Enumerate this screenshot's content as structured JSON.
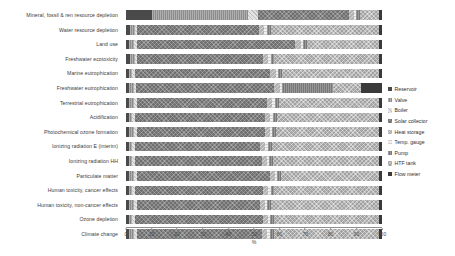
{
  "chart_data": {
    "type": "bar",
    "orientation": "horizontal",
    "stacked": true,
    "stack_mode": "percent",
    "title": "",
    "xlabel": "%",
    "ylabel": "",
    "xlim": [
      0,
      100
    ],
    "xticks": [
      0,
      10,
      20,
      30,
      40,
      50,
      60,
      70,
      80,
      90,
      100
    ],
    "grid": false,
    "legend_position": "right",
    "categories": [
      "Mineral, fossil & ren resource depletion",
      "Water resource depletion",
      "Land use",
      "Freshwater ecotoxicity",
      "Marine eutrophication",
      "Freshwater eutrophication",
      "Terrestrial eutrophication",
      "Acidification",
      "Photochemical ozone formation",
      "Ionizing radiation E (interim)",
      "Ionizing radiation HH",
      "Particulate matter",
      "Human toxicity, cancer effects",
      "Human toxicity, non-cancer effects",
      "Ozone depletion",
      "Climate change"
    ],
    "series": [
      {
        "name": "Reservoir",
        "color": "#4a4a4a",
        "values": [
          10.0,
          1.5,
          1.2,
          1.5,
          1.0,
          1.0,
          1.2,
          1.0,
          1.2,
          1.0,
          1.0,
          1.2,
          1.0,
          1.2,
          1.0,
          1.2
        ]
      },
      {
        "name": "Valve",
        "color": "#8c8c8c",
        "values": [
          37.5,
          2.0,
          2.0,
          2.0,
          1.5,
          2.0,
          2.0,
          1.5,
          2.0,
          1.5,
          1.5,
          2.0,
          1.5,
          2.0,
          1.5,
          2.0
        ]
      },
      {
        "name": "Boiler",
        "color": "#e3e3e3",
        "values": [
          4.0,
          1.0,
          1.0,
          1.0,
          1.0,
          1.0,
          1.0,
          1.0,
          1.0,
          1.0,
          1.0,
          1.0,
          1.0,
          1.0,
          1.0,
          1.0
        ]
      },
      {
        "name": "Solar collector",
        "color": "#6f6f6f",
        "values": [
          35.5,
          47.5,
          62.0,
          49.0,
          53.5,
          54.0,
          51.0,
          51.5,
          50.0,
          49.5,
          50.0,
          52.5,
          50.0,
          48.5,
          50.5,
          49.5
        ]
      },
      {
        "name": "Heat storage",
        "color": "#b3b3b3",
        "values": [
          2.0,
          2.0,
          2.0,
          2.0,
          2.0,
          2.0,
          2.0,
          2.0,
          2.0,
          2.0,
          2.0,
          2.0,
          2.0,
          2.0,
          2.0,
          2.0
        ]
      },
      {
        "name": "Temp. gauge",
        "color": "#efefef",
        "values": [
          1.0,
          1.0,
          1.0,
          1.0,
          1.0,
          1.0,
          1.0,
          1.0,
          1.0,
          1.0,
          1.0,
          1.0,
          1.0,
          1.0,
          1.0,
          1.0
        ]
      },
      {
        "name": "Pump",
        "color": "#777777",
        "values": [
          1.5,
          1.5,
          1.5,
          1.5,
          1.5,
          20.0,
          1.5,
          1.5,
          1.5,
          1.5,
          1.5,
          1.5,
          1.5,
          1.5,
          1.5,
          1.5
        ]
      },
      {
        "name": "HTF tank",
        "color": "#a2a2a2",
        "values": [
          7.5,
          42.5,
          28.3,
          41.0,
          38.5,
          11.0,
          39.3,
          40.5,
          40.3,
          42.5,
          42.0,
          38.8,
          41.0,
          42.8,
          41.5,
          41.8
        ]
      },
      {
        "name": "Flow meter",
        "color": "#3a3a3a",
        "values": [
          1.0,
          1.0,
          1.0,
          1.0,
          1.0,
          8.0,
          1.0,
          1.0,
          1.0,
          1.0,
          1.0,
          1.0,
          1.0,
          1.0,
          1.0,
          1.0
        ]
      }
    ]
  }
}
